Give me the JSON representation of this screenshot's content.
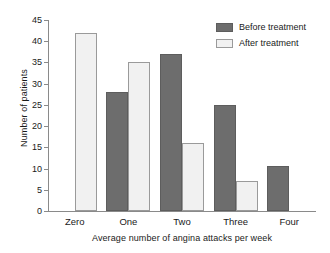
{
  "chart_data": {
    "type": "bar",
    "title": "",
    "xlabel": "Average number of angina attacks per week",
    "ylabel": "Number of patients",
    "categories": [
      "Zero",
      "One",
      "Two",
      "Three",
      "Four"
    ],
    "series": [
      {
        "name": "Before treatment",
        "color": "#6d6d6d",
        "values": [
          0,
          28,
          37,
          25,
          10.5
        ]
      },
      {
        "name": "After treatment",
        "color": "#f1f1f1",
        "values": [
          42,
          35,
          16,
          7,
          0
        ]
      }
    ],
    "ylim": [
      0,
      45
    ],
    "yticks": [
      0,
      5,
      10,
      15,
      20,
      25,
      30,
      35,
      40,
      45
    ],
    "ytick_labels": [
      "0",
      "5",
      "10",
      "15",
      "20",
      "25",
      "30",
      "35",
      "40",
      "45"
    ],
    "grid": false,
    "legend_position": "top-right"
  }
}
